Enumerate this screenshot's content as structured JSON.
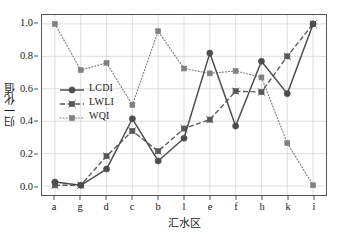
{
  "chart_data": {
    "type": "line",
    "title": "",
    "xlabel": "汇水区",
    "ylabel": "归一化值",
    "categories": [
      "a",
      "g",
      "d",
      "c",
      "b",
      "l",
      "e",
      "f",
      "h",
      "k",
      "i"
    ],
    "ylim": [
      0.0,
      1.0
    ],
    "y_ticks": [
      0.0,
      0.2,
      0.4,
      0.6,
      0.8,
      1.0
    ],
    "y_tick_labels": [
      "0.0",
      "0.2",
      "0.4",
      "0.6",
      "0.8",
      "1.0"
    ],
    "grid": true,
    "legend_position": "upper left inside",
    "series": [
      {
        "name": "LCDI",
        "linestyle": "solid",
        "marker": "circle",
        "color": "#4d4d4d",
        "values": [
          0.025,
          0.005,
          0.105,
          0.415,
          0.155,
          0.295,
          0.82,
          0.37,
          0.77,
          0.57,
          1.0
        ]
      },
      {
        "name": "LWLI",
        "linestyle": "dashed",
        "marker": "x-square",
        "color": "#595959",
        "values": [
          0.005,
          0.005,
          0.185,
          0.34,
          0.215,
          0.355,
          0.41,
          0.585,
          0.58,
          0.8,
          1.0
        ]
      },
      {
        "name": "WQI",
        "linestyle": "dotted",
        "marker": "square",
        "color": "#808080",
        "values": [
          1.0,
          0.715,
          0.76,
          0.5,
          0.955,
          0.725,
          0.695,
          0.71,
          0.67,
          0.265,
          0.005
        ]
      }
    ]
  },
  "legend": {
    "items": [
      {
        "label": "LCDI"
      },
      {
        "label": "LWLI"
      },
      {
        "label": "WQI"
      }
    ]
  },
  "axes": {
    "y_title": "归一化值",
    "x_title": "汇水区"
  }
}
